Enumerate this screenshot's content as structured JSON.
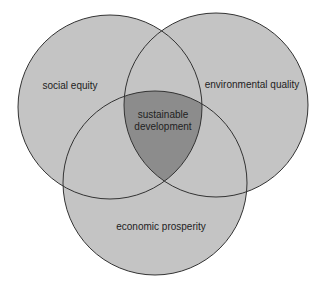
{
  "diagram": {
    "type": "venn",
    "colors": {
      "circle_fill": "#c4c4c4",
      "center_fill": "#8c8c8c",
      "stroke": "#333333",
      "background": "#ffffff"
    },
    "sets": [
      {
        "id": "social",
        "label": "social equity",
        "cx": 110,
        "cy": 107,
        "r": 92
      },
      {
        "id": "environmental",
        "label": "environmental quality",
        "cx": 216,
        "cy": 105,
        "r": 92
      },
      {
        "id": "economic",
        "label": "economic prosperity",
        "cx": 155,
        "cy": 183,
        "r": 92
      }
    ],
    "center": {
      "label_line1": "sustainable",
      "label_line2": "development"
    }
  }
}
